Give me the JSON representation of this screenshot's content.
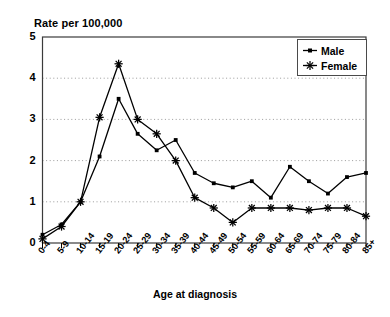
{
  "chart_data": {
    "type": "line",
    "title": "Rate per 100,000",
    "xlabel": "Age at diagnosis",
    "ylabel": "",
    "ylim": [
      0,
      5
    ],
    "yticks": [
      0,
      1,
      2,
      3,
      4,
      5
    ],
    "ytick_labels": [
      "0",
      "1",
      "2",
      "3",
      "4",
      "5"
    ],
    "grid": "horizontal-dotted",
    "legend_position": "top-right",
    "categories": [
      "0-4",
      "5-9",
      "10-14",
      "15-19",
      "20-24",
      "25-29",
      "30-34",
      "35-39",
      "40-44",
      "45-49",
      "50-54",
      "55-59",
      "60-64",
      "65-69",
      "70-74",
      "75-79",
      "80-84",
      "85+"
    ],
    "series": [
      {
        "name": "Male",
        "marker": "square",
        "color": "#000000",
        "values": [
          0.2,
          0.45,
          1.0,
          2.1,
          3.5,
          2.65,
          2.25,
          2.5,
          1.7,
          1.45,
          1.35,
          1.5,
          1.1,
          1.85,
          1.5,
          1.2,
          1.6,
          1.7
        ]
      },
      {
        "name": "Female",
        "marker": "asterisk",
        "color": "#000000",
        "values": [
          0.1,
          0.4,
          1.0,
          3.05,
          4.35,
          3.0,
          2.65,
          2.0,
          1.1,
          0.85,
          0.5,
          0.85,
          0.85,
          0.85,
          0.8,
          0.85,
          0.85,
          0.65
        ]
      }
    ]
  },
  "legend": {
    "items": [
      {
        "label": "Male",
        "marker": "square-line-marker"
      },
      {
        "label": "Female",
        "marker": "asterisk-marker"
      }
    ]
  },
  "axes": {
    "y_title": "Rate per 100,000",
    "x_title": "Age at diagnosis"
  }
}
